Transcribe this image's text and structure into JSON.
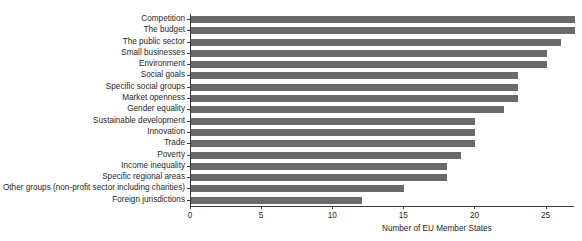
{
  "chart_data": {
    "type": "bar",
    "orientation": "horizontal",
    "title": "",
    "xlabel": "Number of EU Member States",
    "ylabel": "",
    "xlim": [
      0,
      27
    ],
    "grid": false,
    "legend": null,
    "bar_color": "#6a6a6a",
    "axis_color": "#3a3a3a",
    "xticks": [
      0,
      5,
      10,
      15,
      20,
      25
    ],
    "xtick_labels": [
      "0",
      "5",
      "10",
      "15",
      "20",
      "25"
    ],
    "categories": [
      "Competition",
      "The budget",
      "The public sector",
      "Small businesses",
      "Environment",
      "Social goals",
      "Specific social groups",
      "Market openness",
      "Gender equality",
      "Sustainable development",
      "Innovation",
      "Trade",
      "Poverty",
      "Income inequality",
      "Specific regional areas",
      "Other groups (non-profit sector including charities)",
      "Foreign jurisdictions"
    ],
    "values": [
      27,
      27,
      26,
      25,
      25,
      23,
      23,
      23,
      22,
      20,
      20,
      20,
      19,
      18,
      18,
      15,
      12
    ]
  }
}
